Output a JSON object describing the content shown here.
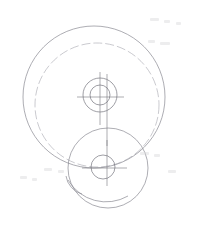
{
  "document": {
    "title": "Engineering Part Outline Drawing",
    "type": "technical-line-drawing",
    "width": 199,
    "height": 231,
    "background_color": "#ffffff"
  },
  "style": {
    "line_color": "#8a8a92",
    "line_color_faint": "#a6a6ae",
    "line_color_dark": "#76767e",
    "stroke_width": 0.7,
    "stroke_width_thin": 0.6,
    "dash_pattern": "9 3",
    "center_dash_pattern": "6 2 1.5 2"
  },
  "geometry": {
    "outer_circle": {
      "name": "outer-boundary-circle",
      "cx": 94,
      "cy": 97,
      "r": 71,
      "style": "solid"
    },
    "dashed_circle": {
      "name": "hidden-bore-circle",
      "cx": 97,
      "cy": 105,
      "r": 62,
      "style": "dashed"
    },
    "upper_hub": {
      "name": "upper-hub-feature",
      "cx": 100,
      "cy": 95,
      "outer_r": 17,
      "inner_r": 10,
      "style": "solid"
    },
    "lower_boss": {
      "name": "lower-boss-circle",
      "cx": 108,
      "cy": 168,
      "r": 40,
      "style": "solid"
    },
    "lower_hole": {
      "name": "lower-hole-circle",
      "cx": 103,
      "cy": 167,
      "r": 12,
      "style": "solid"
    },
    "fillet_arc": {
      "name": "bottom-left-fillet-arc",
      "start_x": 68,
      "start_y": 180,
      "end_x": 128,
      "end_y": 196,
      "radius": 44,
      "style": "solid"
    },
    "tangent_arc": {
      "name": "lower-tangent-arc",
      "start_x": 66,
      "start_y": 176,
      "end_x": 82,
      "end_y": 194,
      "radius": 22,
      "style": "solid"
    },
    "centerlines": {
      "upper_horizontal": {
        "name": "upper-horizontal-centerline",
        "x1": 77,
        "y1": 97,
        "x2": 124,
        "y2": 97
      },
      "upper_vertical": {
        "name": "upper-vertical-centerline",
        "x1": 100,
        "y1": 72,
        "x2": 100,
        "y2": 125
      },
      "upper_vertical_offset": {
        "name": "upper-vertical-centerline-offset",
        "x1": 107,
        "y1": 74,
        "x2": 107,
        "y2": 146
      },
      "lower_horizontal": {
        "name": "lower-horizontal-centerline",
        "x1": 82,
        "y1": 168,
        "x2": 127,
        "y2": 168
      },
      "lower_vertical": {
        "name": "lower-vertical-centerline",
        "x1": 107,
        "y1": 140,
        "x2": 107,
        "y2": 186
      }
    }
  },
  "artifacts": [
    {
      "x": 150,
      "y": 18,
      "w": 9,
      "h": 3
    },
    {
      "x": 164,
      "y": 20,
      "w": 6,
      "h": 3
    },
    {
      "x": 176,
      "y": 22,
      "w": 5,
      "h": 3
    },
    {
      "x": 148,
      "y": 40,
      "w": 7,
      "h": 3
    },
    {
      "x": 160,
      "y": 42,
      "w": 10,
      "h": 3
    },
    {
      "x": 44,
      "y": 168,
      "w": 8,
      "h": 3
    },
    {
      "x": 58,
      "y": 170,
      "w": 6,
      "h": 3
    },
    {
      "x": 140,
      "y": 152,
      "w": 9,
      "h": 3
    },
    {
      "x": 154,
      "y": 154,
      "w": 6,
      "h": 3
    },
    {
      "x": 168,
      "y": 170,
      "w": 8,
      "h": 3
    },
    {
      "x": 20,
      "y": 176,
      "w": 7,
      "h": 3
    },
    {
      "x": 32,
      "y": 178,
      "w": 5,
      "h": 3
    }
  ]
}
